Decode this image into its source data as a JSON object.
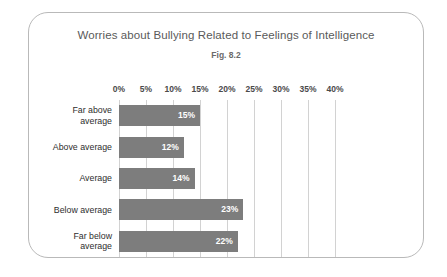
{
  "chart_data": {
    "type": "bar",
    "orientation": "horizontal",
    "title": "Worries about Bullying Related to Feelings of Intelligence",
    "subtitle": "Fig. 8.2",
    "xlabel": "",
    "ylabel": "",
    "xlim": [
      0,
      40
    ],
    "grid": true,
    "legend": false,
    "bar_color": "#7d7d7d",
    "categories": [
      "Far above average",
      "Above average",
      "Average",
      "Below average",
      "Far below average"
    ],
    "category_lines": [
      [
        "Far above",
        "average"
      ],
      [
        "Above average"
      ],
      [
        "Average"
      ],
      [
        "Below average"
      ],
      [
        "Far below",
        "average"
      ]
    ],
    "values": [
      15,
      12,
      14,
      23,
      22
    ],
    "value_labels": [
      "15%",
      "12%",
      "14%",
      "23%",
      "22%"
    ],
    "xticks": [
      0,
      5,
      10,
      15,
      20,
      25,
      30,
      35,
      40
    ],
    "xtick_labels": [
      "0%",
      "5%",
      "10%",
      "15%",
      "20%",
      "25%",
      "30%",
      "35%",
      "40%"
    ]
  }
}
